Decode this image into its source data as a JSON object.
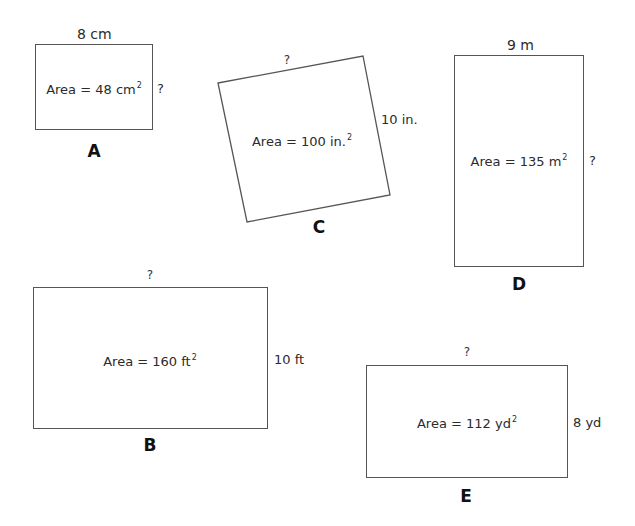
{
  "figures": {
    "A": {
      "label": "A",
      "top_label": "8 cm",
      "side_label": "?",
      "area_prefix": "Area = 48 cm",
      "area_exp": "2"
    },
    "B": {
      "label": "B",
      "top_label": "?",
      "side_label": "10 ft",
      "area_prefix": "Area = 160 ft",
      "area_exp": "2"
    },
    "C": {
      "label": "C",
      "top_label": "?",
      "side_label": "10 in.",
      "area_prefix": "Area = 100 in.",
      "area_exp": "2"
    },
    "D": {
      "label": "D",
      "top_label": "9 m",
      "side_label": "?",
      "area_prefix": "Area = 135 m",
      "area_exp": "2"
    },
    "E": {
      "label": "E",
      "top_label": "?",
      "side_label": "8 yd",
      "area_prefix": "Area = 112 yd",
      "area_exp": "2"
    }
  },
  "colors": {
    "stroke": "#555555",
    "text": "#2b2b2b",
    "background": "#ffffff"
  }
}
